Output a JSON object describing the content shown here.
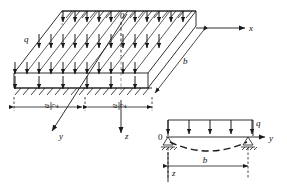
{
  "figure": {
    "stroke_color": "#1a1a1a",
    "background_color": "#ffffff",
    "hatch_color": "#1a1a1a"
  },
  "slab_view": {
    "name": "isometric-slab-view",
    "load_label": "q",
    "origin_label": "0",
    "axis_x_label": "x",
    "axis_y_label": "y",
    "axis_z_label": "z",
    "span_b_label": "b",
    "half_span_numerator": "a",
    "half_span_denominator": "2",
    "half_span_left_label": "a/2",
    "half_span_right_label": "a/2",
    "top_arrow_count": 11,
    "front_arrow_count": 11,
    "mid_arrow_count": 11,
    "supported_edges": 2
  },
  "beam_view": {
    "name": "beam-strip-diagram",
    "origin_label": "0",
    "load_label": "q",
    "axis_y_label": "y",
    "axis_z_label": "z",
    "span_label": "b",
    "load_arrow_count": 5,
    "support_type": "pinned",
    "deflection_style": "dashed"
  }
}
